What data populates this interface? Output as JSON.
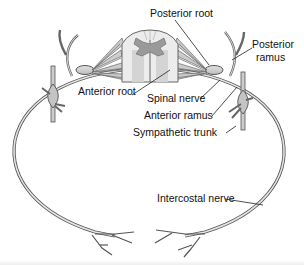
{
  "diagram": {
    "labels": [
      {
        "id": "posterior-root",
        "text": "Posterior root",
        "x": 150,
        "y": 8
      },
      {
        "id": "posterior-ramus-line1",
        "text": "Posterior",
        "x": 252,
        "y": 42
      },
      {
        "id": "posterior-ramus-line2",
        "text": "ramus",
        "x": 256,
        "y": 55
      },
      {
        "id": "anterior-root",
        "text": "Anterior root",
        "x": 78,
        "y": 88
      },
      {
        "id": "spinal-nerve",
        "text": "Spinal nerve",
        "x": 147,
        "y": 94
      },
      {
        "id": "anterior-ramus",
        "text": "Anterior ramus",
        "x": 144,
        "y": 110
      },
      {
        "id": "sympathetic-trunk",
        "text": "Sympathetic trunk",
        "x": 133,
        "y": 127
      },
      {
        "id": "intercostal-nerve",
        "text": "Intercostal nerve",
        "x": 157,
        "y": 193
      }
    ],
    "colors": {
      "nerve_fill": "#d0d0d0",
      "nerve_stroke": "#555555",
      "gray_matter": "#9a9a9a",
      "white_matter": "#ececec",
      "text": "#111111"
    }
  }
}
